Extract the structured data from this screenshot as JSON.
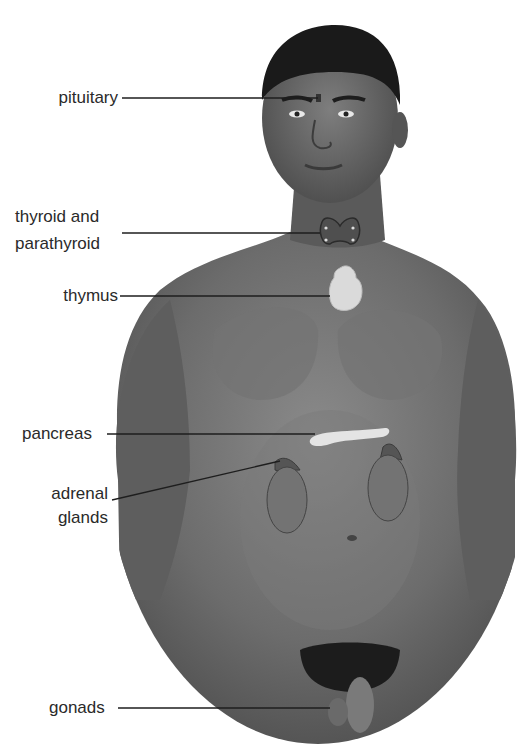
{
  "labels": {
    "pituitary": "pituitary",
    "thyroid_line1": "thyroid and",
    "thyroid_line2": "parathyroid",
    "thymus": "thymus",
    "pancreas": "pancreas",
    "adrenal_line1": "adrenal",
    "adrenal_line2": "glands",
    "gonads": "gonads"
  },
  "colors": {
    "skin_dark": "#4a4a4a",
    "skin_mid": "#6e6e6e",
    "skin_light": "#8c8c8c",
    "hair": "#1a1a1a",
    "gland_light": "#d8d8d8",
    "thyroid": "#555555",
    "leader_line": "#1e1e1e",
    "label_text": "#2a2a2a"
  }
}
